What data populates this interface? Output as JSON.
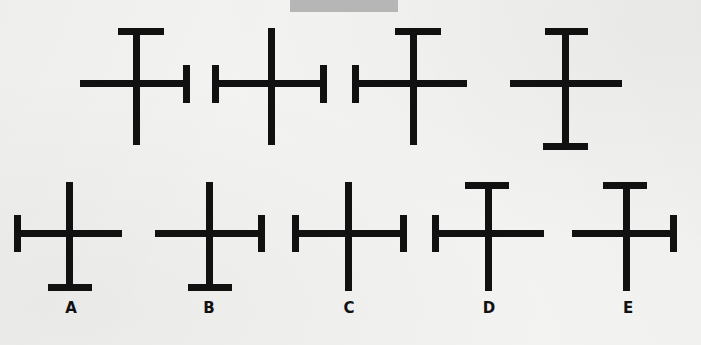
{
  "page": {
    "type": "figure-analogy-puzzle",
    "background_color": "#f3f3f1",
    "ink_color": "#111111",
    "width": 701,
    "height": 345
  },
  "redaction": {
    "name": "redacted-title-bar",
    "color": "#b6b6b6",
    "x": 290,
    "y": 0,
    "width": 108,
    "height": 12,
    "text": ""
  },
  "sequence": {
    "name": "problem-sequence-row",
    "count": 4,
    "items": [
      {
        "id": "seq-1",
        "description": "cross with top horizontal cap bar and right-end vertical tick",
        "features": [
          "top-cap-bar",
          "right-end-tick"
        ]
      },
      {
        "id": "seq-2",
        "description": "cross with vertical ticks at both ends of horizontal bar",
        "features": [
          "left-end-tick",
          "right-end-tick"
        ]
      },
      {
        "id": "seq-3",
        "description": "cross with top horizontal cap bar and left-end vertical tick",
        "features": [
          "top-cap-bar",
          "left-end-tick"
        ]
      },
      {
        "id": "seq-4",
        "description": "cross with top horizontal cap bar and bottom horizontal cap bar",
        "features": [
          "top-cap-bar",
          "bottom-cap-bar"
        ]
      }
    ]
  },
  "options": {
    "name": "answer-options-row",
    "count": 5,
    "items": [
      {
        "id": "option-a",
        "label": "A",
        "description": "cross with left-end vertical tick and bottom horizontal cap bar",
        "features": [
          "left-end-tick",
          "bottom-cap-bar"
        ]
      },
      {
        "id": "option-b",
        "label": "B",
        "description": "cross with right-end vertical tick and bottom horizontal cap bar",
        "features": [
          "right-end-tick",
          "bottom-cap-bar"
        ]
      },
      {
        "id": "option-c",
        "label": "C",
        "description": "cross with vertical ticks at both ends of horizontal bar",
        "features": [
          "left-end-tick",
          "right-end-tick"
        ]
      },
      {
        "id": "option-d",
        "label": "D",
        "description": "cross with top horizontal cap bar and left-end vertical tick",
        "features": [
          "top-cap-bar",
          "left-end-tick"
        ]
      },
      {
        "id": "option-e",
        "label": "E",
        "description": "cross with top horizontal cap bar and right-end vertical tick",
        "features": [
          "top-cap-bar",
          "right-end-tick"
        ]
      }
    ]
  }
}
